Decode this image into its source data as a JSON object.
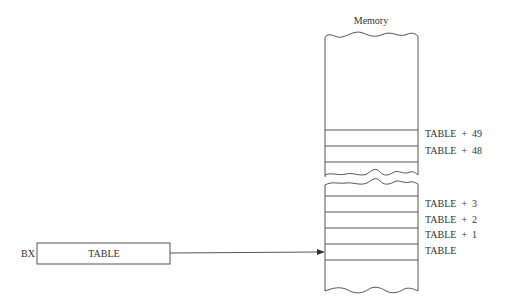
{
  "memory": {
    "title": "Memory",
    "upper_labels": [
      "TABLE  +  49",
      "TABLE  +  48"
    ],
    "lower_labels": [
      "TABLE  +  3",
      "TABLE  +  2",
      "TABLE  +  1",
      "TABLE"
    ]
  },
  "register": {
    "name": "BX",
    "value": "TABLE"
  }
}
